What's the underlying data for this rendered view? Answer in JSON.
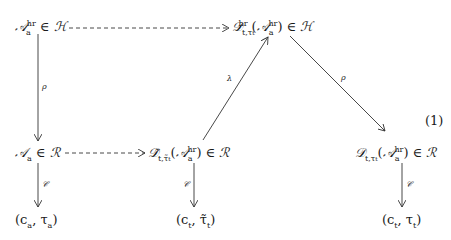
{
  "diagram": {
    "equation_number": "(1)",
    "nodes": {
      "top_left": {
        "base": "𝒜",
        "sub": "a",
        "sup": "hr",
        "rel": " ∈ ",
        "set": "ℋ"
      },
      "top_right": {
        "base": "𝒟",
        "sub": "t,τ",
        "subsub": "t",
        "sup": "hr",
        "arg_base": "𝒜",
        "arg_sub": "a",
        "arg_sup": "hr",
        "rel": " ∈ ",
        "set": "ℋ"
      },
      "mid_left": {
        "base": "𝒜",
        "sub": "a",
        "rel": " ∈ ",
        "set": "ℛ"
      },
      "mid_center": {
        "base": "𝒟̃",
        "sub": "t,τ̃",
        "subsub": "t",
        "arg_base": "𝒜",
        "arg_sub": "a",
        "arg_sup": "hr",
        "rel": " ∈ ",
        "set": "ℛ"
      },
      "mid_right": {
        "base": "𝒟",
        "sub": "t,τ",
        "subsub": "t",
        "arg_base": "𝒜",
        "arg_sub": "a",
        "arg_sup": "hr",
        "rel": " ∈ ",
        "set": "ℛ"
      },
      "bot_left": {
        "text": "(c",
        "sub1": "a",
        "mid": ", τ",
        "sub2": "a",
        "end": ")"
      },
      "bot_center": {
        "text": "(c",
        "sub1": "t",
        "mid": ", τ̃",
        "sub2": "t",
        "end": ")"
      },
      "bot_right": {
        "text": "(c",
        "sub1": "t",
        "mid": ", τ",
        "sub2": "t",
        "end": ")"
      }
    },
    "arrows": [
      {
        "from": "top_left",
        "to": "top_right",
        "style": "dashed",
        "label": ""
      },
      {
        "from": "top_left",
        "to": "mid_left",
        "style": "solid",
        "label": "ρ"
      },
      {
        "from": "mid_left",
        "to": "mid_center",
        "style": "dashed",
        "label": ""
      },
      {
        "from": "mid_center",
        "to": "top_right",
        "style": "solid",
        "label": "λ"
      },
      {
        "from": "top_right",
        "to": "mid_right",
        "style": "solid",
        "label": "ρ"
      },
      {
        "from": "mid_left",
        "to": "bot_left",
        "style": "solid",
        "label": "𝒞"
      },
      {
        "from": "mid_center",
        "to": "bot_center",
        "style": "solid",
        "label": "𝒞"
      },
      {
        "from": "mid_right",
        "to": "bot_right",
        "style": "solid",
        "label": "𝒞"
      }
    ],
    "colors": {
      "ink": "#1a1a1a",
      "background": "#ffffff"
    }
  }
}
